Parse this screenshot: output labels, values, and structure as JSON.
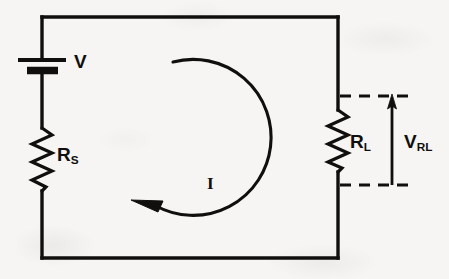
{
  "figure": {
    "type": "electrical-circuit-schematic",
    "background_color": "#f6f5f3",
    "ink_color": "#100f0d"
  },
  "components": {
    "source": {
      "name": "battery",
      "label": "V",
      "symbol": "battery-cell",
      "position": "left-branch-top"
    },
    "source_resistor": {
      "name": "resistor",
      "label_base": "R",
      "label_sub": "S",
      "label_full": "RS",
      "symbol": "zigzag-resistor",
      "position": "left-branch-lower"
    },
    "load_resistor": {
      "name": "resistor",
      "label_base": "R",
      "label_sub": "L",
      "label_full": "RL",
      "symbol": "zigzag-resistor",
      "position": "right-branch"
    }
  },
  "annotations": {
    "current": {
      "label": "I",
      "symbol": "circular-arrow-counterclockwise-at-tip",
      "direction": "clockwise-arc-ending-arrowhead-pointing-left",
      "description": "Loop current arrow drawn as a large open circular arc inside the circuit mesh"
    },
    "load_voltage": {
      "label_base": "V",
      "label_sub": "RL",
      "label_full": "VRL",
      "symbol": "up-arrow-with-dashed-leader-lines",
      "description": "Voltage across the load resistor, measured between two dashed projection lines"
    }
  },
  "wires": {
    "top_rail": "horizontal-top",
    "bottom_rail": "horizontal-bottom",
    "left_rail": "vertical-left",
    "right_rail": "vertical-right"
  }
}
